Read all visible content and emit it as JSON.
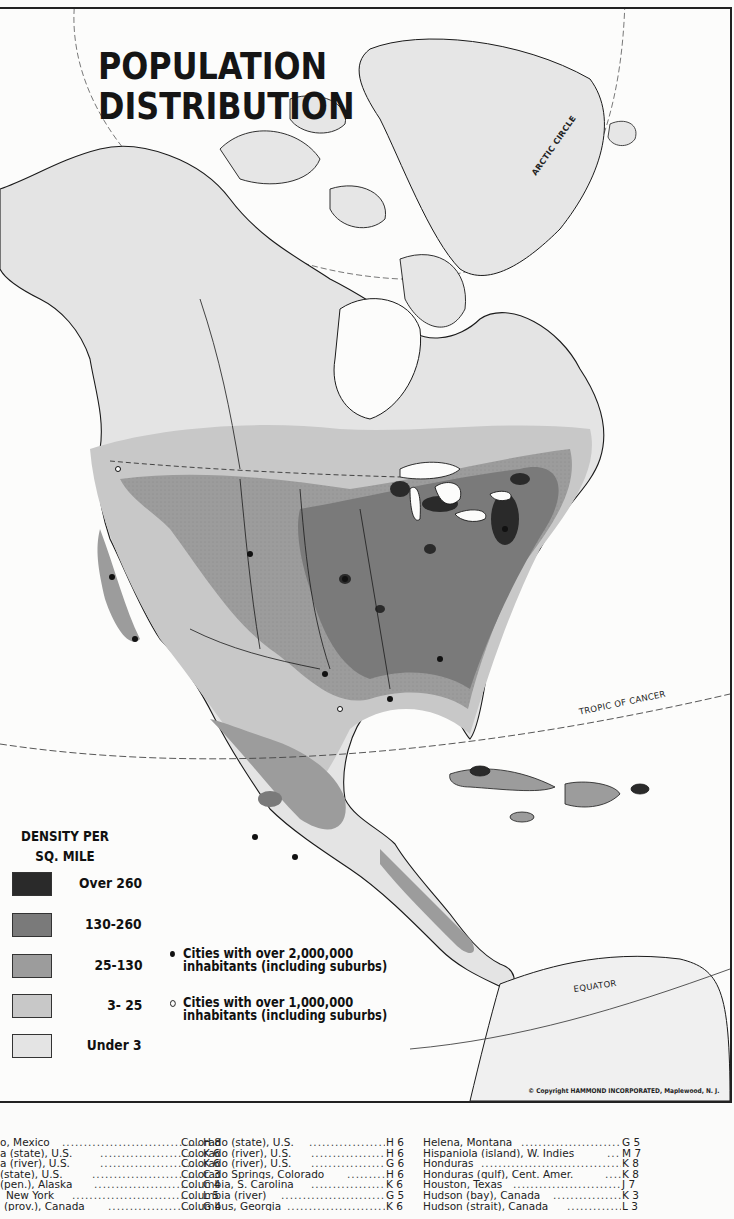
{
  "map": {
    "title_line1": "POPULATION",
    "title_line2": "DISTRIBUTION",
    "reference_lines": {
      "arctic_circle": "ARCTIC CIRCLE",
      "tropic_of_cancer": "TROPIC OF CANCER",
      "equator": "EQUATOR"
    },
    "copyright": "© Copyright HAMMOND INCORPORATED, Maplewood, N. J.",
    "colors": {
      "water": "#fcfcfb",
      "coastline": "#1a1a1a",
      "border": "#222222"
    }
  },
  "legend": {
    "title_line1": "DENSITY PER",
    "title_line2": "SQ. MILE",
    "items": [
      {
        "label": "Over 260",
        "color": "#2a2a2a"
      },
      {
        "label": "130-260",
        "color": "#7a7a7a"
      },
      {
        "label": "25-130",
        "color": "#9c9c9c"
      },
      {
        "label": "3- 25",
        "color": "#c8c8c8"
      },
      {
        "label": "Under 3",
        "color": "#e4e4e4"
      }
    ],
    "cities": [
      {
        "symbol": "filled-dot",
        "line1": "Cities with over 2,000,000",
        "line2": "inhabitants (including suburbs)"
      },
      {
        "symbol": "open-dot",
        "line1": "Cities with over 1,000,000",
        "line2": "inhabitants (including suburbs)"
      }
    ]
  },
  "index": {
    "columns": [
      [
        {
          "name": "o, Mexico",
          "grid": "H 8"
        },
        {
          "name": "a (state), U.S.",
          "grid": "K 6"
        },
        {
          "name": "a (river), U.S.",
          "grid": "K 6"
        },
        {
          "name": "(state), U.S.",
          "grid": "C 3"
        },
        {
          "name": "(pen.), Alaska",
          "grid": "C 4"
        },
        {
          "name": "New York",
          "grid": "L 5"
        },
        {
          "name": "(prov.), Canada",
          "grid": "G 4"
        }
      ],
      [
        {
          "name": "Colorado (state), U.S.",
          "grid": "H 6"
        },
        {
          "name": "Colorado (river), U.S.",
          "grid": "H 6"
        },
        {
          "name": "Colorado (river), U.S.",
          "grid": "G 6"
        },
        {
          "name": "Colorado Springs, Colorado",
          "grid": "H 6"
        },
        {
          "name": "Columbia, S. Carolina",
          "grid": "K 6"
        },
        {
          "name": "Columbia (river)",
          "grid": "G 5"
        },
        {
          "name": "Columbus, Georgia",
          "grid": "K 6"
        }
      ],
      [
        {
          "name": "Helena, Montana",
          "grid": "G 5"
        },
        {
          "name": "Hispaniola (island), W. Indies",
          "grid": "M 7"
        },
        {
          "name": "Honduras",
          "grid": "K 8"
        },
        {
          "name": "Honduras (gulf), Cent. Amer.",
          "grid": "K 8"
        },
        {
          "name": "Houston, Texas",
          "grid": "J 7"
        },
        {
          "name": "Hudson (bay), Canada",
          "grid": "K 3"
        },
        {
          "name": "Hudson (strait), Canada",
          "grid": "L 3"
        }
      ]
    ]
  }
}
